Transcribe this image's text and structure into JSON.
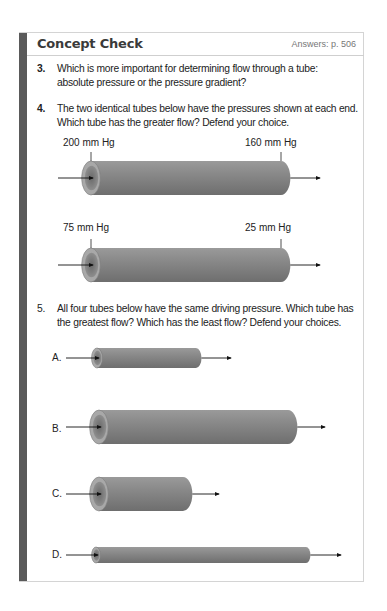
{
  "header": {
    "title": "Concept Check",
    "answers": "Answers: p. 506"
  },
  "questions": [
    {
      "number": "3.",
      "lines": [
        "Which is more important for determining flow through a tube:",
        "absolute pressure or the pressure gradient?"
      ]
    },
    {
      "number": "4.",
      "lines": [
        "The two identical tubes below have the pressures shown at each end.",
        "Which tube has the greater flow? Defend your choice."
      ]
    },
    {
      "number": "5.",
      "lines": [
        "All four tubes below have the same driving pressure. Which tube has",
        "the greatest flow? Which has the least flow? Defend your choices."
      ]
    }
  ],
  "q4_tubes": [
    {
      "left_pressure": "200 mm Hg",
      "right_pressure": "160 mm Hg"
    },
    {
      "left_pressure": "75 mm Hg",
      "right_pressure": "25 mm Hg"
    }
  ],
  "q5_tubes": [
    {
      "label": "A."
    },
    {
      "label": "B."
    },
    {
      "label": "C."
    },
    {
      "label": "D."
    }
  ],
  "colors": {
    "sidebar": "#5a5a5a",
    "tube": "#8c8c8c"
  }
}
